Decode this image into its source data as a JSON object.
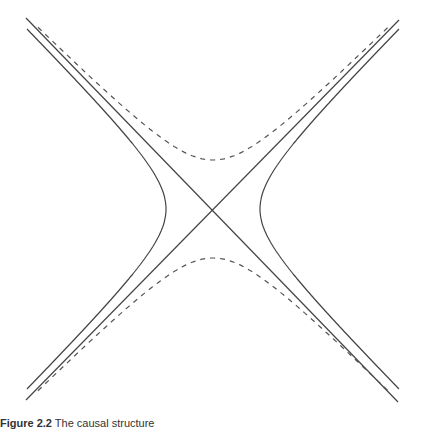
{
  "figure": {
    "caption_label": "Figure 2.2",
    "caption_text": "The causal structure",
    "center": {
      "x": 213,
      "y": 209
    },
    "colors": {
      "line": "#444444",
      "dashed": "#555555",
      "background": "#ffffff"
    },
    "asymptotes": [
      {
        "name": "asymptote-descending",
        "x1": 26,
        "y1": 18,
        "x2": 398,
        "y2": 402
      },
      {
        "name": "asymptote-ascending",
        "x1": 26,
        "y1": 400,
        "x2": 399,
        "y2": 20
      }
    ],
    "solid_hyperbola": {
      "orientation": "horizontal",
      "a": 47,
      "ymin": 29,
      "ymax": 389
    },
    "dashed_hyperbola": {
      "orientation": "vertical",
      "a": 49,
      "xmin": 38,
      "xmax": 388
    }
  }
}
